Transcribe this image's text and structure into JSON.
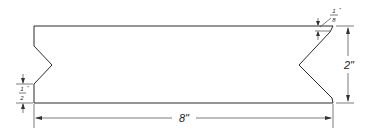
{
  "diagram": {
    "type": "technical-drawing",
    "stroke_color": "#2a2a2a",
    "dimensions": {
      "length": {
        "label": "8\"",
        "value_in": 8
      },
      "height": {
        "label": "2\"",
        "value_in": 2
      },
      "notch_offset": {
        "numerator": "1",
        "denominator": "2",
        "quote": "\"",
        "value_in": 0.5
      },
      "chamfer": {
        "numerator": "1",
        "denominator": "8",
        "quote": "\"",
        "value_in": 0.125
      }
    }
  }
}
